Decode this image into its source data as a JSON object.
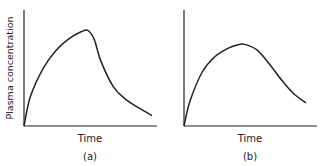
{
  "chart_data": [
    {
      "type": "line",
      "panel_label": "(a)",
      "xlabel": "Time",
      "ylabel": "Plasma concentration",
      "xlim": [
        0,
        1
      ],
      "ylim": [
        0,
        1
      ],
      "grid": false,
      "series": [
        {
          "name": "curve-a",
          "x": [
            0,
            0.05,
            0.15,
            0.25,
            0.35,
            0.45,
            0.5,
            0.55,
            0.6,
            0.7,
            0.8,
            0.9,
            1.0
          ],
          "y": [
            0,
            0.28,
            0.55,
            0.72,
            0.83,
            0.9,
            0.91,
            0.82,
            0.62,
            0.37,
            0.25,
            0.17,
            0.1
          ]
        }
      ]
    },
    {
      "type": "line",
      "panel_label": "(b)",
      "xlabel": "Time",
      "ylabel": "",
      "xlim": [
        0,
        1
      ],
      "ylim": [
        0,
        1
      ],
      "grid": false,
      "series": [
        {
          "name": "curve-b",
          "x": [
            0,
            0.05,
            0.15,
            0.25,
            0.35,
            0.45,
            0.5,
            0.6,
            0.7,
            0.8,
            0.9,
            1.0
          ],
          "y": [
            0,
            0.22,
            0.47,
            0.6,
            0.67,
            0.71,
            0.71,
            0.66,
            0.54,
            0.4,
            0.28,
            0.2
          ]
        }
      ]
    }
  ]
}
